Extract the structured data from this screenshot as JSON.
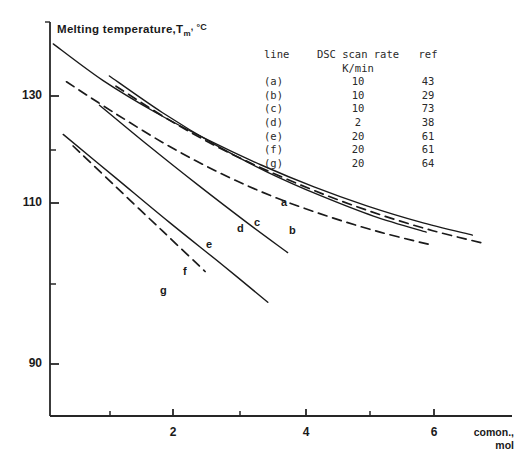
{
  "axes": {
    "y_title_main": "Melting temperature,",
    "y_title_sym": "T",
    "y_title_sub": "m",
    "y_title_unit": ", °C",
    "x_label_line1": "comon.,",
    "x_label_line2": "mol",
    "y_ticks": [
      "130",
      "110",
      "90"
    ],
    "x_ticks": [
      "2",
      "4",
      "6"
    ]
  },
  "legend": {
    "headers": {
      "line": "line",
      "rate": "DSC scan rate",
      "ref": "ref",
      "unit": "K/min"
    },
    "rows": [
      {
        "line": "(a)",
        "rate": "10",
        "ref": "43"
      },
      {
        "line": "(b)",
        "rate": "10",
        "ref": "29"
      },
      {
        "line": "(c)",
        "rate": "10",
        "ref": "73"
      },
      {
        "line": "(d)",
        "rate": "2",
        "ref": "38"
      },
      {
        "line": "(e)",
        "rate": "20",
        "ref": "61"
      },
      {
        "line": "(f)",
        "rate": "20",
        "ref": "61"
      },
      {
        "line": "(g)",
        "rate": "20",
        "ref": "64"
      }
    ]
  },
  "curve_labels": {
    "a": "a",
    "b": "b",
    "c": "c",
    "d": "d",
    "e": "e",
    "f": "f",
    "g": "g"
  },
  "chart_data": {
    "type": "line",
    "xlabel": "comon., mol",
    "ylabel": "Melting temperature, Tm, °C",
    "xlim": [
      0,
      7.0
    ],
    "ylim": [
      84,
      138
    ],
    "grid": false,
    "legend_position": "upper-right-table",
    "xticks": [
      2,
      4,
      6
    ],
    "xticks_minor": [
      1,
      3,
      5
    ],
    "yticks": [
      130,
      110,
      90
    ],
    "yticks_minor": [
      120,
      100
    ],
    "series": [
      {
        "name": "a",
        "style": "solid",
        "scan_rate_K_per_min": 10,
        "ref": 43,
        "x": [
          0.05,
          0.8,
          1.6,
          2.4,
          3.2,
          4.0,
          4.8,
          5.6,
          6.4
        ],
        "y": [
          135.0,
          130.0,
          125.6,
          121.8,
          118.4,
          115.4,
          112.8,
          110.6,
          108.8
        ]
      },
      {
        "name": "b",
        "style": "dashed",
        "scan_rate_K_per_min": 10,
        "ref": 29,
        "x": [
          1.0,
          1.8,
          2.6,
          3.4,
          4.2,
          5.0,
          5.8,
          6.6
        ],
        "y": [
          129.2,
          124.6,
          120.6,
          117.2,
          114.2,
          111.6,
          109.4,
          107.6
        ]
      },
      {
        "name": "c",
        "style": "solid",
        "scan_rate_K_per_min": 10,
        "ref": 73,
        "x": [
          0.9,
          1.7,
          2.5,
          3.3,
          4.1,
          4.9,
          5.7
        ],
        "y": [
          130.6,
          125.6,
          121.2,
          117.4,
          114.2,
          111.4,
          109.2
        ]
      },
      {
        "name": "d",
        "style": "dashed",
        "scan_rate_K_per_min": 2,
        "ref": 38,
        "x": [
          0.25,
          1.0,
          1.8,
          2.6,
          3.4,
          4.2,
          5.0,
          5.8
        ],
        "y": [
          129.8,
          125.4,
          121.0,
          117.2,
          114.0,
          111.4,
          109.2,
          107.4
        ]
      },
      {
        "name": "e",
        "style": "solid",
        "scan_rate_K_per_min": 20,
        "ref": 61,
        "x": [
          0.75,
          1.5,
          2.25,
          3.0,
          3.6
        ],
        "y": [
          126.6,
          121.0,
          115.6,
          110.4,
          106.4
        ]
      },
      {
        "name": "f",
        "style": "solid",
        "scan_rate_K_per_min": 20,
        "ref": 61,
        "x": [
          0.2,
          1.0,
          1.8,
          2.6,
          3.3
        ],
        "y": [
          122.6,
          116.6,
          110.6,
          104.8,
          99.6
        ]
      },
      {
        "name": "g",
        "style": "dashed",
        "scan_rate_K_per_min": 20,
        "ref": 64,
        "x": [
          0.35,
          1.0,
          1.7,
          2.35
        ],
        "y": [
          121.0,
          115.4,
          109.4,
          103.8
        ]
      }
    ]
  }
}
